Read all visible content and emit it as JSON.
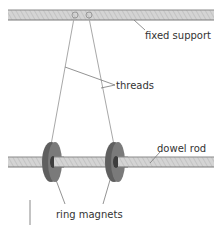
{
  "diagram": {
    "labels": {
      "fixed_support": "fixed support",
      "threads": "threads",
      "dowel_rod": "dowel rod",
      "ring_magnets": "ring magnets"
    },
    "colors": {
      "rod_fill": "#c8c8c8",
      "rod_edge": "#7a7a7a",
      "magnet_face": "#6e6e6e",
      "magnet_rim": "#8a8a8a",
      "thread": "#a8a8a8",
      "leader": "#777777",
      "text": "#333333"
    }
  }
}
